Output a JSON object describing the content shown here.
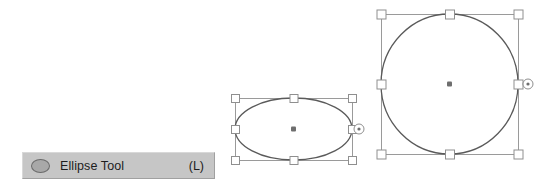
{
  "canvas": {
    "width": 552,
    "height": 184,
    "background": "#ffffff"
  },
  "theme": {
    "shape_stroke": "#5a5a5a",
    "bbox_stroke": "#9a9a9a",
    "handle_fill": "#ffffff",
    "handle_stroke": "#8f8f8f",
    "center_dot": "#6e6e6e",
    "tooltip_bg": "#c6c6c6",
    "tooltip_text": "#1d1d1d",
    "tooltip_icon_fill": "#a8a8a8"
  },
  "tooltip": {
    "icon_name": "ellipse-icon",
    "label": "Ellipse Tool",
    "shortcut": "(L)"
  },
  "shapes": [
    {
      "id": "ellipse-shape",
      "type": "ellipse",
      "selected": true,
      "bbox": {
        "x": 235,
        "y": 98,
        "width": 117,
        "height": 62
      },
      "center": {
        "x": 293.5,
        "y": 129
      },
      "handle_size": 8,
      "rotation_handle": {
        "x": 359,
        "y": 129,
        "radius": 5
      },
      "handles": [
        "top-left",
        "top-center",
        "top-right",
        "middle-left",
        "middle-right",
        "bottom-left",
        "bottom-center",
        "bottom-right"
      ]
    },
    {
      "id": "circle-shape",
      "type": "ellipse",
      "selected": true,
      "bbox": {
        "x": 381,
        "y": 14,
        "width": 137,
        "height": 140
      },
      "center": {
        "x": 449.5,
        "y": 84
      },
      "handle_size": 9,
      "rotation_handle": {
        "x": 528,
        "y": 84,
        "radius": 5
      },
      "handles": [
        "top-left",
        "top-center",
        "top-right",
        "middle-left",
        "middle-right",
        "bottom-left",
        "bottom-center",
        "bottom-right"
      ]
    }
  ]
}
